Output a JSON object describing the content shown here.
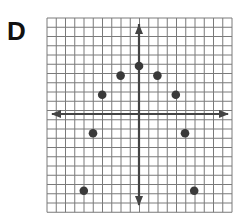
{
  "panel_label": "D",
  "chart_data": {
    "type": "scatter",
    "title": "",
    "xlabel": "",
    "ylabel": "",
    "grid": true,
    "axes_arrows": true,
    "xlim": [
      -10,
      10
    ],
    "ylim": [
      -10,
      10
    ],
    "points": [
      {
        "x": -6,
        "y": -8
      },
      {
        "x": -5,
        "y": -2
      },
      {
        "x": -4,
        "y": 2
      },
      {
        "x": -2,
        "y": 4
      },
      {
        "x": 0,
        "y": 5
      },
      {
        "x": 2,
        "y": 4
      },
      {
        "x": 4,
        "y": 2
      },
      {
        "x": 5,
        "y": -2
      },
      {
        "x": 6,
        "y": -8
      }
    ]
  },
  "colors": {
    "grid": "#7a7a7a",
    "axis": "#444444",
    "point": "#3a3a3a"
  }
}
